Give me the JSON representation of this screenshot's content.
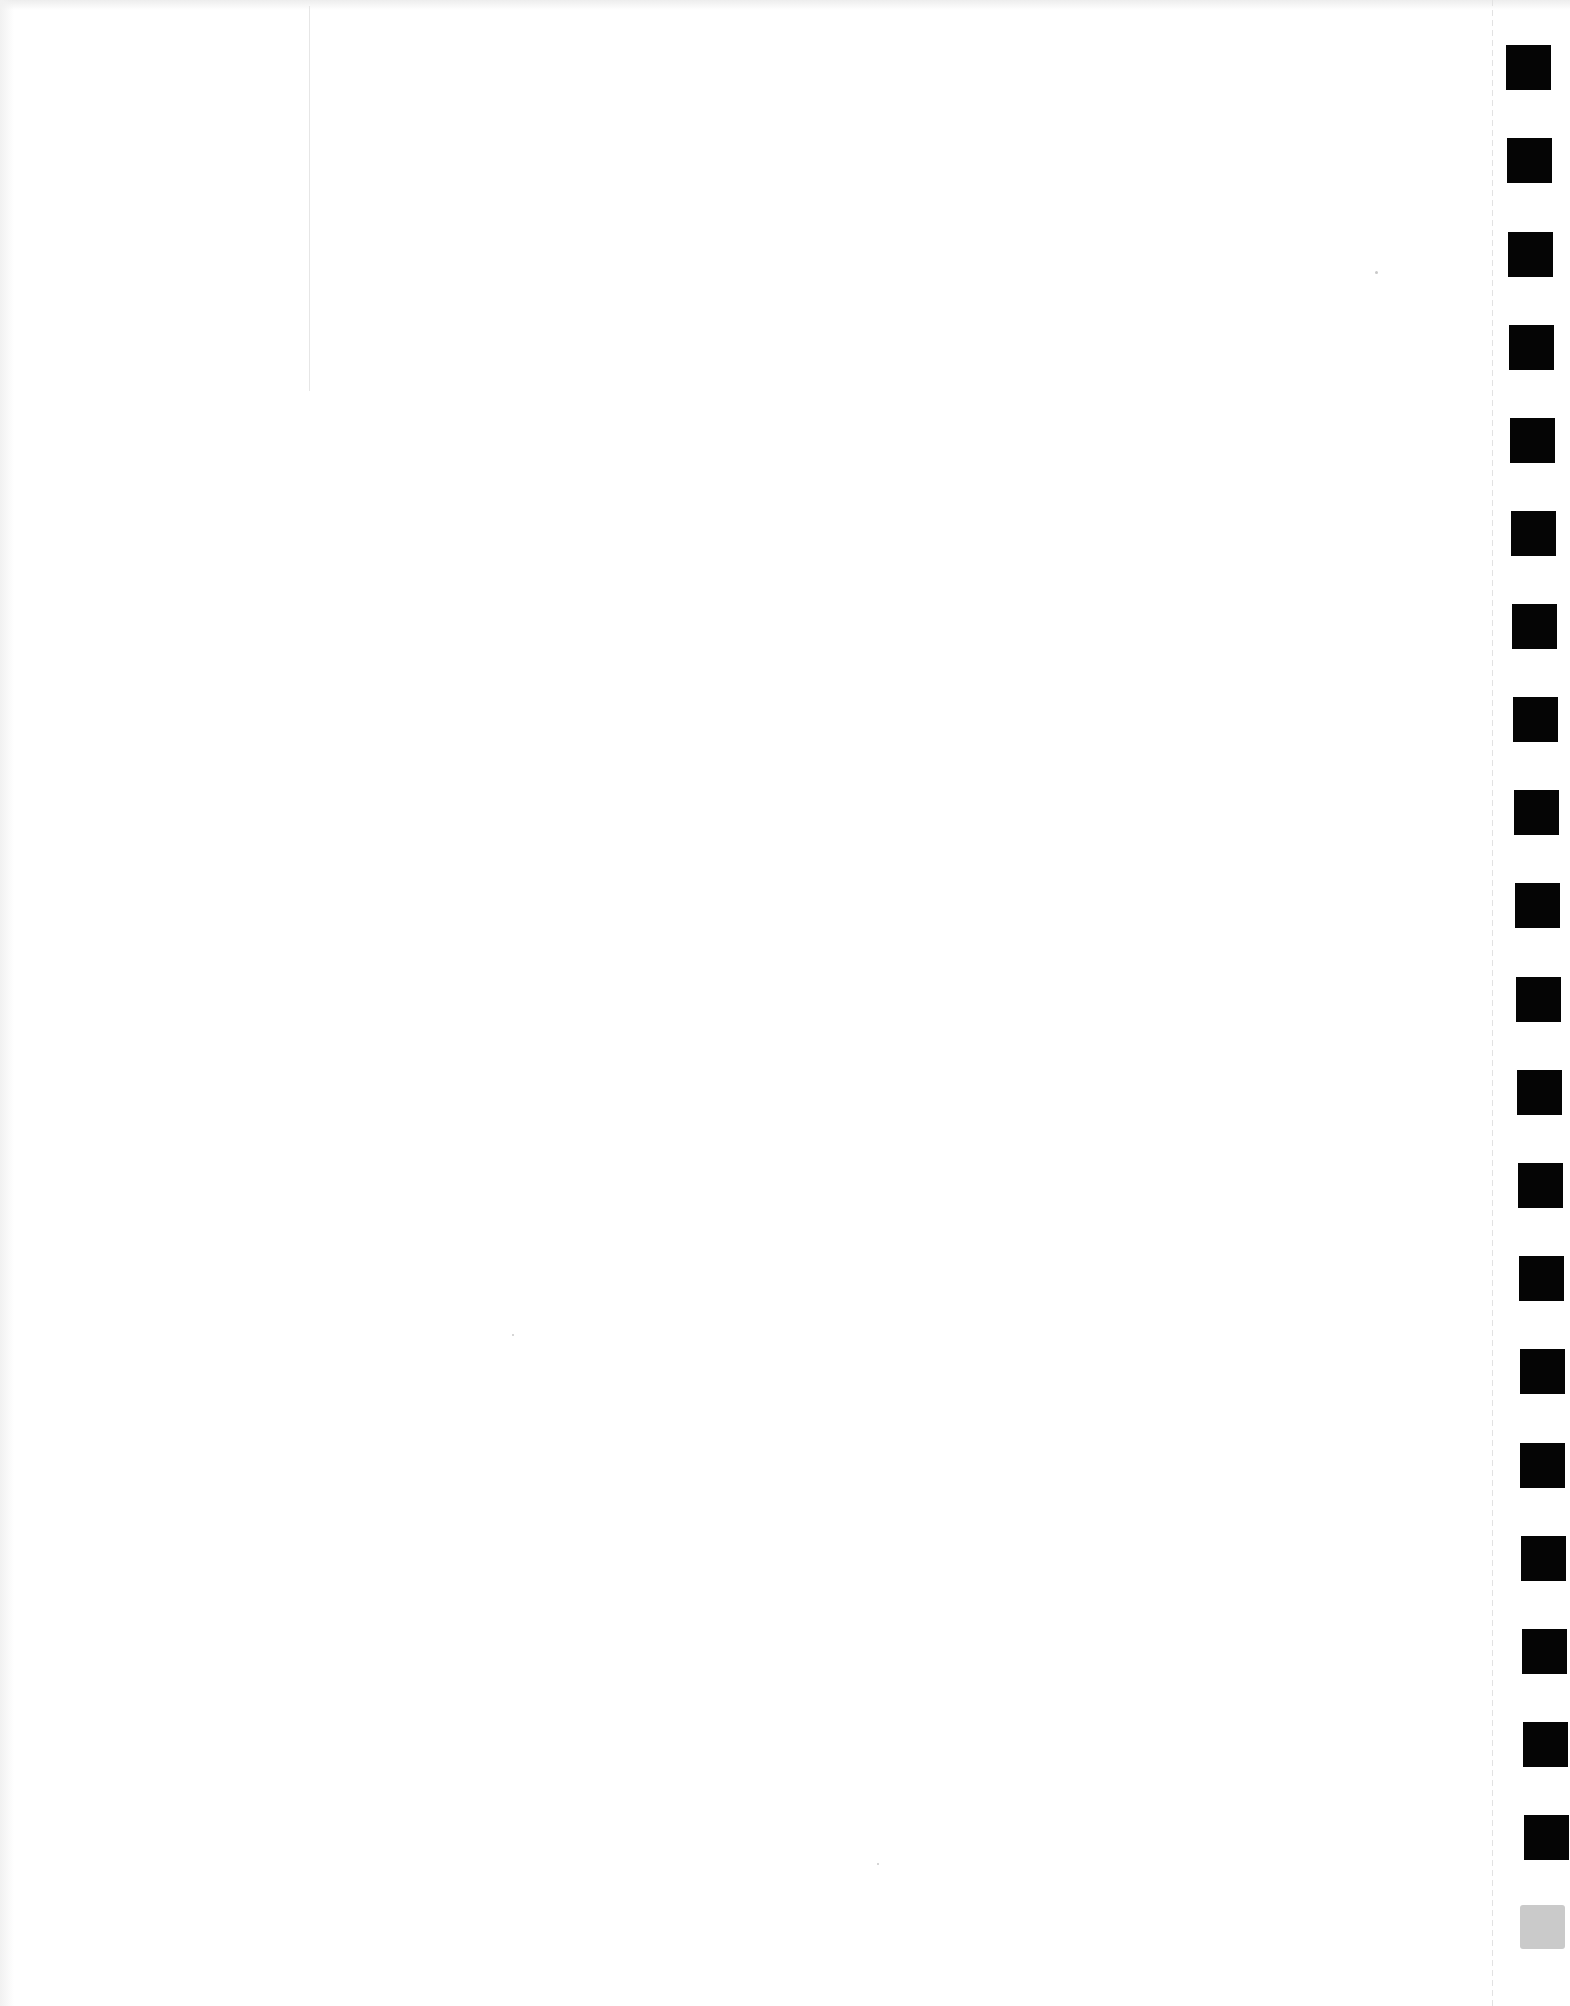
{
  "document": {
    "type": "blank scanned page",
    "text": ""
  },
  "binding_marks": {
    "color": "#050505",
    "count_black": 20,
    "grey_tab_color": "#cacaca",
    "positions": [
      {
        "x": 1506,
        "y": 45
      },
      {
        "x": 1507,
        "y": 138
      },
      {
        "x": 1508,
        "y": 232
      },
      {
        "x": 1509,
        "y": 325
      },
      {
        "x": 1510,
        "y": 418
      },
      {
        "x": 1511,
        "y": 511
      },
      {
        "x": 1512,
        "y": 604
      },
      {
        "x": 1513,
        "y": 697
      },
      {
        "x": 1514,
        "y": 790
      },
      {
        "x": 1515,
        "y": 883
      },
      {
        "x": 1516,
        "y": 977
      },
      {
        "x": 1517,
        "y": 1070
      },
      {
        "x": 1518,
        "y": 1163
      },
      {
        "x": 1519,
        "y": 1256
      },
      {
        "x": 1520,
        "y": 1349
      },
      {
        "x": 1520,
        "y": 1443
      },
      {
        "x": 1521,
        "y": 1536
      },
      {
        "x": 1522,
        "y": 1629
      },
      {
        "x": 1523,
        "y": 1722
      },
      {
        "x": 1524,
        "y": 1815
      }
    ],
    "grey_tab": {
      "x": 1520,
      "y": 1905
    }
  }
}
